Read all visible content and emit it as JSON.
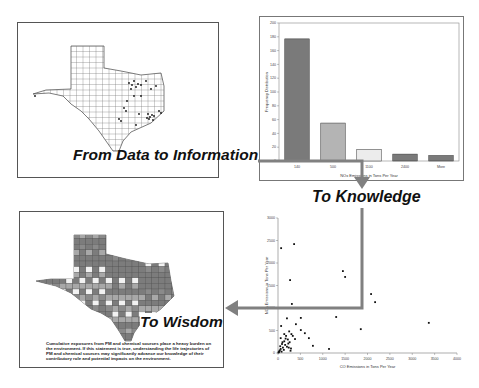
{
  "captions": {
    "data_to_information": "From Data to Information",
    "to_knowledge": "To Knowledge",
    "to_wisdom": "To Wisdom"
  },
  "panels": {
    "map_top": {
      "description": "Texas county map with emission source points"
    },
    "map_bottom": {
      "description": "Texas county choropleth map"
    },
    "wisdom_text": "Cumulative exposures from PM and chemical sources place a heavy burden on the environment. If this statement is true, understanding the life trajectories of PM and chemical sources may significantly advance our knowledge of their contributory role and potential impacts on the environment."
  },
  "colors": {
    "arrow": "#808080",
    "bar_dark": "#7a7a7a",
    "bar_mid": "#b4b4b4",
    "bar_light": "#ececec",
    "map_county_dark": "#7c7c7c",
    "map_county_mid": "#a8a8a8",
    "map_county_light": "#f2f2f2"
  },
  "chart_data": [
    {
      "type": "bar",
      "title": "",
      "categories": [
        "140",
        "500",
        "1100",
        "2400",
        "More"
      ],
      "values": [
        177,
        55,
        17,
        10,
        8
      ],
      "xlabel": "NOx Emissions in Tons Per Year",
      "ylabel": "Frequency Distribution",
      "ylim": [
        0,
        200
      ],
      "yticks": [
        "0",
        "20",
        "40",
        "60",
        "80",
        "100",
        "120",
        "140",
        "160",
        "180",
        "200"
      ],
      "grid": false,
      "legend": null
    },
    {
      "type": "scatter",
      "title": "",
      "xlabel": "CO Emissions in Tons Per Year",
      "ylabel": "NOx Emissions in Tons Per Year",
      "xlim": [
        0,
        4000
      ],
      "ylim": [
        0,
        3000
      ],
      "xticks": [
        "0",
        "500",
        "1000",
        "1500",
        "2000",
        "2500",
        "3000",
        "3500",
        "4000"
      ],
      "yticks": [
        "0",
        "500",
        "1000",
        "1500",
        "2000",
        "2500",
        "3000"
      ],
      "grid": false,
      "legend": null,
      "points": [
        [
          70,
          2330
        ],
        [
          360,
          2420
        ],
        [
          270,
          1620
        ],
        [
          310,
          1090
        ],
        [
          1450,
          1820
        ],
        [
          1500,
          1690
        ],
        [
          2080,
          1310
        ],
        [
          2170,
          1130
        ],
        [
          3370,
          670
        ],
        [
          1850,
          530
        ],
        [
          1300,
          800
        ],
        [
          510,
          780
        ],
        [
          200,
          770
        ],
        [
          70,
          600
        ],
        [
          400,
          640
        ],
        [
          510,
          510
        ],
        [
          600,
          440
        ],
        [
          690,
          330
        ],
        [
          780,
          160
        ],
        [
          1140,
          90
        ],
        [
          380,
          310
        ],
        [
          250,
          480
        ],
        [
          300,
          420
        ],
        [
          180,
          380
        ],
        [
          220,
          300
        ],
        [
          140,
          260
        ],
        [
          260,
          240
        ],
        [
          90,
          200
        ],
        [
          160,
          180
        ],
        [
          200,
          140
        ],
        [
          110,
          120
        ],
        [
          60,
          90
        ],
        [
          40,
          60
        ],
        [
          30,
          40
        ],
        [
          80,
          30
        ],
        [
          130,
          70
        ],
        [
          50,
          150
        ],
        [
          100,
          240
        ],
        [
          170,
          320
        ],
        [
          230,
          210
        ],
        [
          290,
          100
        ],
        [
          20,
          20
        ],
        [
          10,
          10
        ],
        [
          60,
          330
        ],
        [
          140,
          420
        ],
        [
          330,
          380
        ],
        [
          280,
          50
        ],
        [
          240,
          120
        ]
      ]
    }
  ]
}
